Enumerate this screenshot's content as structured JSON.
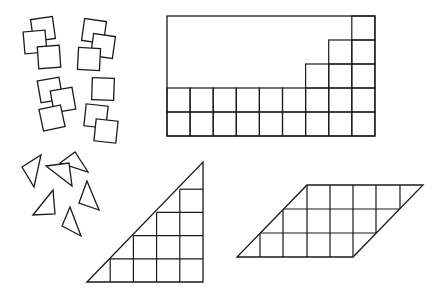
{
  "figure": {
    "stroke_color": "#1a1a1a",
    "background": "#ffffff"
  },
  "loose_squares": [
    {
      "cx": 43,
      "cy": 29,
      "size": 22,
      "rot": -8
    },
    {
      "cx": 35,
      "cy": 42,
      "size": 22,
      "rot": -5
    },
    {
      "cx": 49,
      "cy": 57,
      "size": 22,
      "rot": -4
    },
    {
      "cx": 94,
      "cy": 31,
      "size": 22,
      "rot": 8
    },
    {
      "cx": 103,
      "cy": 46,
      "size": 22,
      "rot": 8
    },
    {
      "cx": 89,
      "cy": 59,
      "size": 22,
      "rot": 3
    },
    {
      "cx": 50,
      "cy": 90,
      "size": 22,
      "rot": -10
    },
    {
      "cx": 63,
      "cy": 100,
      "size": 22,
      "rot": -10
    },
    {
      "cx": 52,
      "cy": 118,
      "size": 22,
      "rot": -12
    },
    {
      "cx": 103,
      "cy": 89,
      "size": 22,
      "rot": 2
    },
    {
      "cx": 96,
      "cy": 116,
      "size": 22,
      "rot": 6
    },
    {
      "cx": 106,
      "cy": 131,
      "size": 22,
      "rot": 6
    }
  ],
  "loose_triangles": [
    {
      "points": "22,167 41,155 34,187"
    },
    {
      "points": "60,163 75,152 88,172"
    },
    {
      "points": "46,166 69,163 72,186"
    },
    {
      "points": "33,215 53,190 55,214"
    },
    {
      "points": "79,203 87,181 99,210"
    },
    {
      "points": "62,226 70,207 81,236"
    }
  ],
  "tiled_rectangle": {
    "x": 167,
    "y": 16,
    "cols": 9,
    "rows": 5,
    "cell_w": 23.1,
    "cell_h": 24,
    "column_heights": [
      2,
      2,
      2,
      2,
      2,
      2,
      3,
      4,
      5
    ]
  },
  "tiled_triangle": {
    "points": "87,282 203,162 203,282",
    "origin_x": 87,
    "origin_y": 282,
    "cols": 5,
    "cell": 23.2
  },
  "tiled_parallelogram": {
    "points": "237,257 353,257 423,185 307,185",
    "bottom_y": 257,
    "top_y": 185,
    "rows": 3,
    "vertical_lines_x": [
      260,
      283,
      307,
      330,
      353,
      376,
      400
    ]
  }
}
